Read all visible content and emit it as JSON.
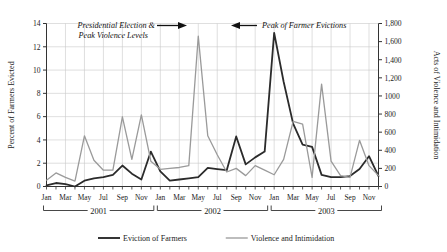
{
  "chart_data": {
    "type": "line",
    "title": "",
    "ylabel": "Percent of Farmers Evicted",
    "y2label": "Acts of Violence and Intimidation",
    "xlabel": "",
    "ylim": [
      0,
      14
    ],
    "y2lim": [
      0,
      1800
    ],
    "yticks": [
      "0",
      "2",
      "4",
      "6",
      "8",
      "10",
      "12",
      "14"
    ],
    "ytick_values": [
      0,
      2,
      4,
      6,
      8,
      10,
      12,
      14
    ],
    "y2ticks": [
      "0",
      "200",
      "400",
      "600",
      "800",
      "1000",
      "1,200",
      "1,400",
      "1,600",
      "1,800"
    ],
    "y2tick_values": [
      0,
      200,
      400,
      600,
      800,
      1000,
      1200,
      1400,
      1600,
      1800
    ],
    "grid": true,
    "legend_position": "bottom",
    "x": [
      "2001-01",
      "2001-02",
      "2001-03",
      "2001-04",
      "2001-05",
      "2001-06",
      "2001-07",
      "2001-08",
      "2001-09",
      "2001-10",
      "2001-11",
      "2001-12",
      "2002-01",
      "2002-02",
      "2002-03",
      "2002-04",
      "2002-05",
      "2002-06",
      "2002-07",
      "2002-08",
      "2002-09",
      "2002-10",
      "2002-11",
      "2002-12",
      "2003-01",
      "2003-02",
      "2003-03",
      "2003-04",
      "2003-05",
      "2003-06",
      "2003-07",
      "2003-08",
      "2003-09",
      "2003-10",
      "2003-11",
      "2003-12"
    ],
    "xtick_labels": [
      "Jan",
      "Mar",
      "May",
      "Jul",
      "Sep",
      "Nov",
      "Jan",
      "Mar",
      "May",
      "Jul",
      "Sep",
      "Nov",
      "Jan",
      "Mar",
      "May",
      "Jul",
      "Sep",
      "Nov"
    ],
    "year_groups": [
      {
        "label": "2001",
        "start": "2001-01",
        "end": "2001-12"
      },
      {
        "label": "2002",
        "start": "2002-01",
        "end": "2002-12"
      },
      {
        "label": "2003",
        "start": "2003-01",
        "end": "2003-12"
      }
    ],
    "series": [
      {
        "name": "Eviction of Farmers",
        "axis": "left",
        "color": "#2b2b2b",
        "width": 1.8,
        "values": [
          0.1,
          0.3,
          0.2,
          0.0,
          0.5,
          0.7,
          0.8,
          1.0,
          1.8,
          1.1,
          0.6,
          3.0,
          1.3,
          0.5,
          0.6,
          0.7,
          0.8,
          1.6,
          1.5,
          1.4,
          4.3,
          1.9,
          2.5,
          3.0,
          13.2,
          9.0,
          5.4,
          3.6,
          3.4,
          1.0,
          0.8,
          0.8,
          0.9,
          1.5,
          2.6,
          0.9
        ]
      },
      {
        "name": "Violence and Intimidation",
        "axis": "right",
        "color": "#9a9a9a",
        "width": 1.3,
        "values": [
          70,
          150,
          100,
          60,
          560,
          290,
          180,
          180,
          770,
          300,
          790,
          280,
          190,
          200,
          210,
          230,
          1660,
          560,
          350,
          160,
          200,
          120,
          230,
          180,
          130,
          300,
          720,
          690,
          100,
          1130,
          280,
          120,
          100,
          510,
          230,
          120
        ]
      }
    ],
    "annotations": [
      {
        "id": "election-annotation",
        "lines": [
          "Presidential Election &",
          "Peak Violence Levels"
        ],
        "arrow": "right"
      },
      {
        "id": "eviction-annotation",
        "lines": [
          "Peak of Farmer Evictions"
        ],
        "arrow": "left"
      }
    ]
  },
  "legend": {
    "items": [
      {
        "label": "Eviction of Farmers",
        "color": "#2b2b2b",
        "width": 1.9
      },
      {
        "label": "Violence and Intimidation",
        "color": "#9a9a9a",
        "width": 1.3
      }
    ]
  }
}
